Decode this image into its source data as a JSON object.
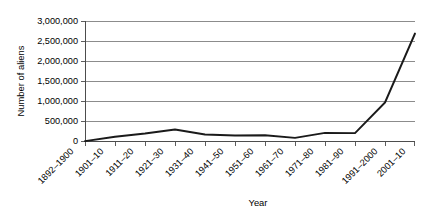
{
  "chart_data": {
    "type": "line",
    "title": "",
    "xlabel": "Year",
    "ylabel": "Number of aliens",
    "categories": [
      "1892–1900",
      "1901–10",
      "1911–20",
      "1921–30",
      "1931–40",
      "1941–50",
      "1951–60",
      "1961–70",
      "1971–80",
      "1981–90",
      "1991–2000",
      "2001–10"
    ],
    "values": [
      10000,
      120000,
      200000,
      300000,
      175000,
      150000,
      155000,
      90000,
      215000,
      210000,
      975000,
      2700000
    ],
    "ylim": [
      0,
      3000000
    ],
    "ytick_labels": [
      "0",
      "500,000",
      "1,000,000",
      "1,500,000",
      "2,000,000",
      "2,500,000",
      "3,000,000"
    ],
    "ytick_values": [
      0,
      500000,
      1000000,
      1500000,
      2000000,
      2500000,
      3000000
    ],
    "grid": "horizontal",
    "legend": "none",
    "series_color": "#1a1a1a",
    "gridline_color": "#808080",
    "background_color": "#ffffff",
    "xtick_label_rotation": "-45"
  }
}
